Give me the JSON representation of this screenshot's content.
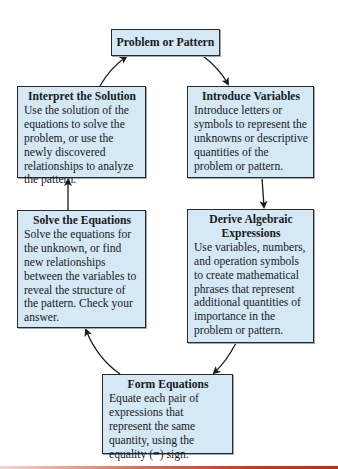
{
  "diagram": {
    "type": "cycle-flowchart",
    "nodes": [
      {
        "id": "problem",
        "title": "Problem or Pattern",
        "body": ""
      },
      {
        "id": "introduce",
        "title": "Introduce Variables",
        "body": "Introduce letters or symbols to represent the unknowns or descriptive quantities of the problem or pattern."
      },
      {
        "id": "derive",
        "title": "Derive Algebraic Expressions",
        "body": "Use variables, numbers, and operation symbols to create mathematical phrases that represent additional quantities of importance in the problem or pattern."
      },
      {
        "id": "form",
        "title": "Form Equations",
        "body": "Equate each pair of expressions that represent the same quantity, using the equality (=) sign."
      },
      {
        "id": "solve",
        "title": "Solve the Equations",
        "body": "Solve the equations for the unknown, or find new relationships between the variables to reveal the structure of the pattern. Check your answer."
      },
      {
        "id": "interpret",
        "title": "Interpret the Solution",
        "body": "Use the solution of the equations to solve the problem, or use the newly discovered relationships to analyze the pattern."
      }
    ],
    "edges": [
      {
        "from": "problem",
        "to": "introduce"
      },
      {
        "from": "introduce",
        "to": "derive"
      },
      {
        "from": "derive",
        "to": "form"
      },
      {
        "from": "form",
        "to": "solve"
      },
      {
        "from": "solve",
        "to": "interpret"
      },
      {
        "from": "interpret",
        "to": "problem"
      }
    ]
  },
  "colors": {
    "box_fill": "#d4e8f5",
    "box_border": "#2a2a2a",
    "arrow": "#1a1a1a",
    "bottom_rule": "#c23b22"
  }
}
